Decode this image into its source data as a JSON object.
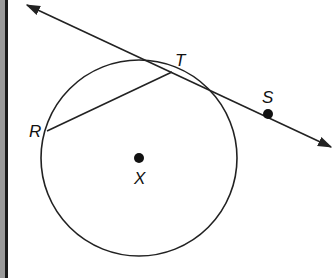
{
  "diagram": {
    "type": "geometry-circle-tangent",
    "colors": {
      "stroke": "#222222",
      "background": "#ffffff",
      "border": "#1a1a1a",
      "border_texture": "#9a9a9a"
    },
    "circle": {
      "center_label": "X",
      "cx": 139,
      "cy": 158,
      "r": 98
    },
    "points": [
      {
        "label": "T",
        "x": 172,
        "y": 70,
        "label_x": 175,
        "label_y": 66
      },
      {
        "label": "S",
        "x": 268,
        "y": 114,
        "label_x": 262,
        "label_y": 103
      },
      {
        "label": "R",
        "x": 47,
        "y": 131,
        "label_x": 29,
        "label_y": 137
      },
      {
        "label": "X",
        "x": 139,
        "y": 158,
        "label_x": 134,
        "label_y": 184
      }
    ],
    "tangent_line": {
      "label": "line TS",
      "x1": 27,
      "y1": 5,
      "x2": 331,
      "y2": 147
    },
    "chord": {
      "label": "RT",
      "from": "R",
      "to": "T"
    }
  }
}
